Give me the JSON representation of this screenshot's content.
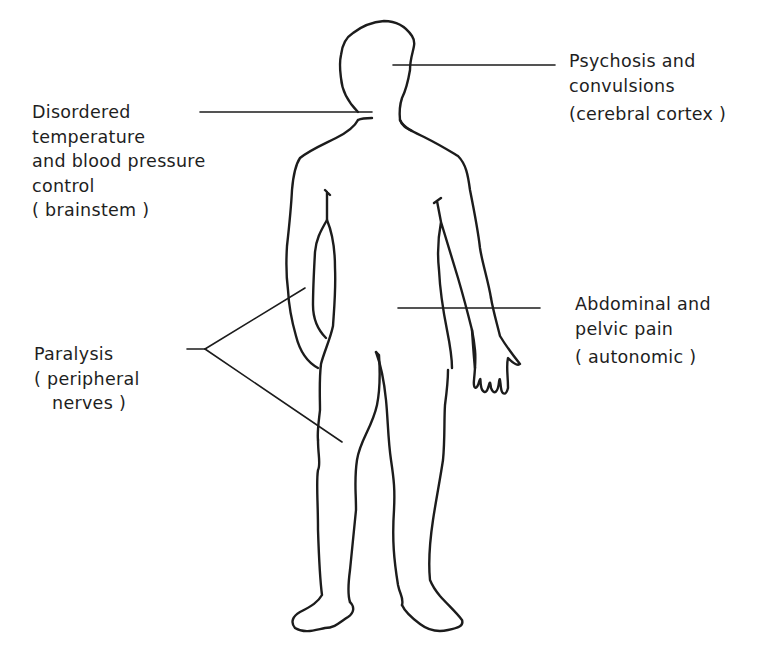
{
  "figure": {
    "type": "anatomical-diagram",
    "colors": {
      "line": "#1c1c1c",
      "background": "#ffffff"
    }
  },
  "labels": {
    "brainstem": {
      "lines": [
        "Disordered",
        "temperature",
        "and blood pressure",
        "control"
      ],
      "region": "( brainstem )",
      "points_to": "neck / brainstem"
    },
    "cortex": {
      "lines": [
        "Psychosis and",
        "convulsions"
      ],
      "region": "(cerebral cortex )",
      "points_to": "head / cerebral cortex"
    },
    "autonomic": {
      "lines": [
        "Abdominal and",
        "pelvic pain"
      ],
      "region": "( autonomic )",
      "points_to": "abdomen"
    },
    "paralysis": {
      "lines": [
        "Paralysis"
      ],
      "region_lines": [
        "( peripheral",
        "nerves )"
      ],
      "points_to": [
        "left arm",
        "left thigh"
      ]
    }
  }
}
